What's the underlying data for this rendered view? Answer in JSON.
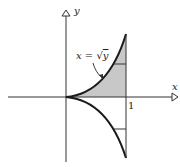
{
  "diagram": {
    "axis_x_label": "x",
    "axis_y_label": "y",
    "tick_x_1": "1",
    "curve_label_lhs": "x = ",
    "curve_label_sqrt": "√",
    "curve_label_arg": "y",
    "colors": {
      "ink": "#1a1a1a",
      "shade": "#c8c8c8"
    }
  }
}
